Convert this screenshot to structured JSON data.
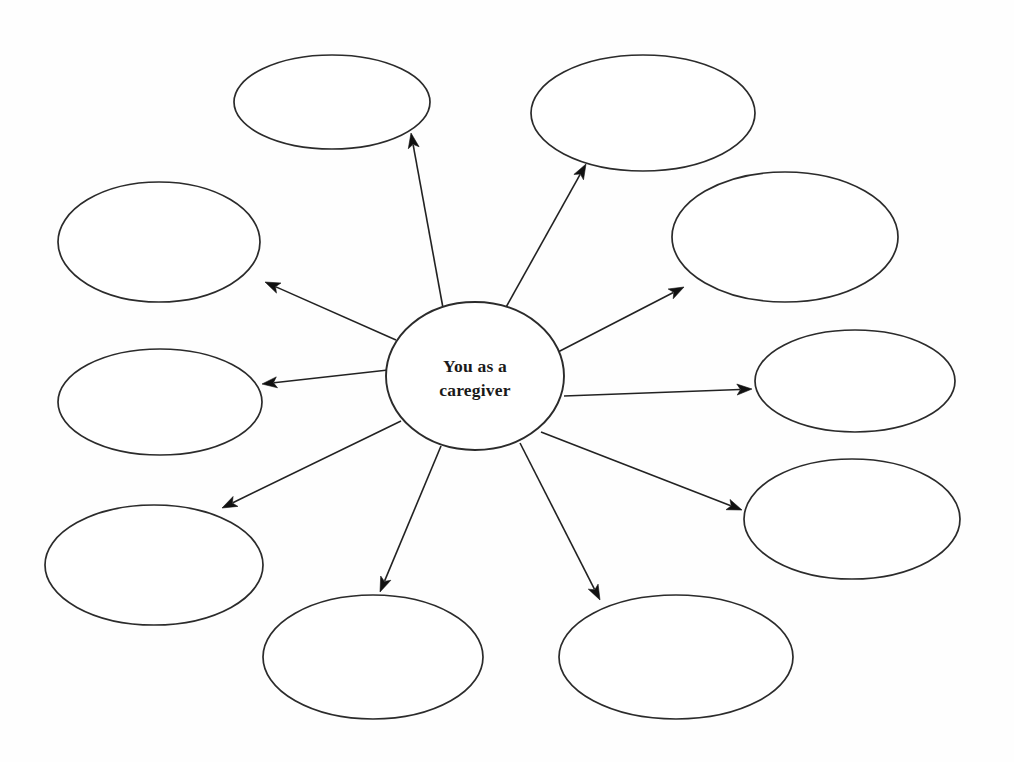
{
  "diagram": {
    "type": "spider-web-mind-map",
    "title_text": "",
    "background_color": "#fefefe",
    "line_color": "#222222",
    "outline_color": "#2b2b2b",
    "text_color": "#1a1a1a",
    "hub": {
      "label_line1": "You as a",
      "label_line2": "caregiver",
      "cx": 475,
      "cy": 376,
      "rx": 89,
      "ry": 74
    },
    "nodes": [
      {
        "id": "node-top-left",
        "label": "",
        "cx": 332,
        "cy": 102,
        "rx": 98,
        "ry": 47
      },
      {
        "id": "node-top-right",
        "label": "",
        "cx": 643,
        "cy": 113,
        "rx": 112,
        "ry": 58
      },
      {
        "id": "node-left-upper",
        "label": "",
        "cx": 159,
        "cy": 242,
        "rx": 101,
        "ry": 60
      },
      {
        "id": "node-right-upper",
        "label": "",
        "cx": 785,
        "cy": 237,
        "rx": 113,
        "ry": 65
      },
      {
        "id": "node-left-middle",
        "label": "",
        "cx": 160,
        "cy": 402,
        "rx": 102,
        "ry": 53
      },
      {
        "id": "node-right-middle",
        "label": "",
        "cx": 855,
        "cy": 381,
        "rx": 100,
        "ry": 51
      },
      {
        "id": "node-left-lower",
        "label": "",
        "cx": 154,
        "cy": 565,
        "rx": 109,
        "ry": 60
      },
      {
        "id": "node-right-lower",
        "label": "",
        "cx": 852,
        "cy": 519,
        "rx": 108,
        "ry": 60
      },
      {
        "id": "node-bottom-left",
        "label": "",
        "cx": 373,
        "cy": 657,
        "rx": 110,
        "ry": 62
      },
      {
        "id": "node-bottom-right",
        "label": "",
        "cx": 676,
        "cy": 657,
        "rx": 117,
        "ry": 62
      }
    ],
    "connectors": [
      {
        "id": "arrow-to-top-left",
        "from": "hub",
        "to": "node-top-left",
        "x1": 443,
        "y1": 308,
        "x2": 411,
        "y2": 133
      },
      {
        "id": "arrow-to-top-right",
        "from": "hub",
        "to": "node-top-right",
        "x1": 505,
        "y1": 309,
        "x2": 586,
        "y2": 164
      },
      {
        "id": "arrow-to-left-upper",
        "from": "hub",
        "to": "node-left-upper",
        "x1": 396,
        "y1": 340,
        "x2": 265,
        "y2": 282
      },
      {
        "id": "arrow-to-right-upper",
        "from": "hub",
        "to": "node-right-upper",
        "x1": 558,
        "y1": 352,
        "x2": 684,
        "y2": 287
      },
      {
        "id": "arrow-to-left-middle",
        "from": "hub",
        "to": "node-left-middle",
        "x1": 388,
        "y1": 370,
        "x2": 262,
        "y2": 384
      },
      {
        "id": "arrow-to-right-middle",
        "from": "hub",
        "to": "node-right-middle",
        "x1": 564,
        "y1": 396,
        "x2": 752,
        "y2": 389
      },
      {
        "id": "arrow-to-left-lower",
        "from": "hub",
        "to": "node-left-lower",
        "x1": 401,
        "y1": 421,
        "x2": 222,
        "y2": 508
      },
      {
        "id": "arrow-to-right-lower",
        "from": "hub",
        "to": "node-right-lower",
        "x1": 541,
        "y1": 432,
        "x2": 742,
        "y2": 510
      },
      {
        "id": "arrow-to-bottom-left",
        "from": "hub",
        "to": "node-bottom-left",
        "x1": 441,
        "y1": 446,
        "x2": 380,
        "y2": 592
      },
      {
        "id": "arrow-to-bottom-right",
        "from": "hub",
        "to": "node-bottom-right",
        "x1": 520,
        "y1": 443,
        "x2": 600,
        "y2": 600
      }
    ]
  }
}
